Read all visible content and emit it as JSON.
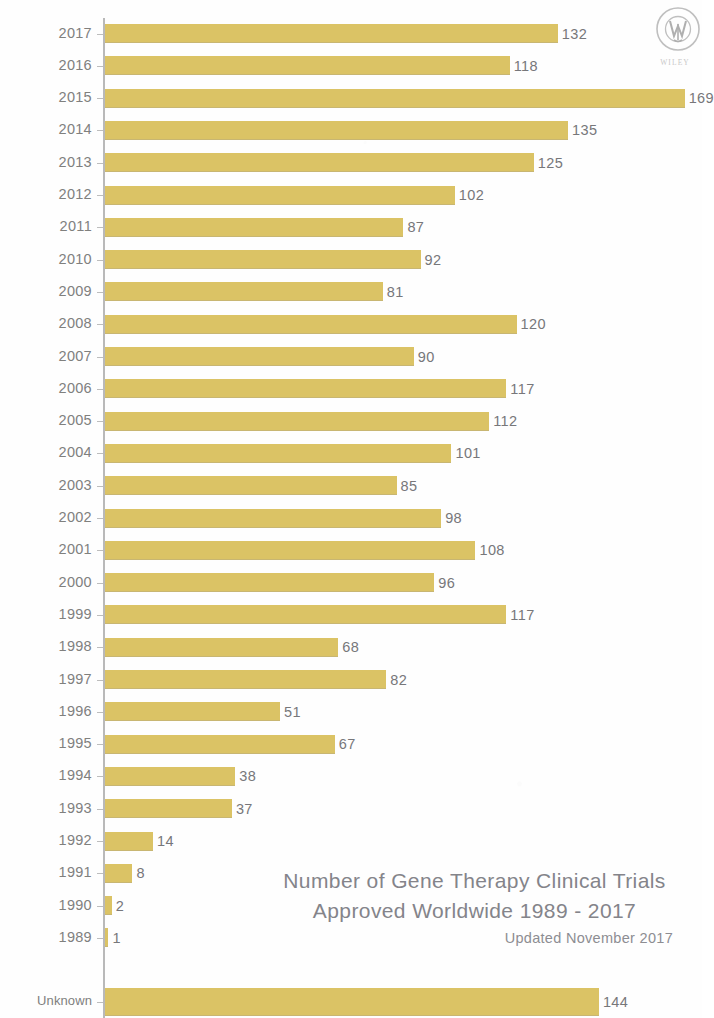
{
  "logo": {
    "name": "wiley-logo",
    "wordmark": "WILEY"
  },
  "chart_data": {
    "type": "bar",
    "orientation": "horizontal",
    "title": "Number of Gene Therapy Clinical Trials Approved Worldwide 1989 - 2017",
    "title_line_1": "Number of Gene Therapy Clinical Trials",
    "title_line_2": "Approved Worldwide 1989 - 2017",
    "subtitle": "Updated November 2017",
    "xlabel": "",
    "ylabel": "",
    "grid": false,
    "legend": false,
    "bar_color": "#dbc365",
    "label_color": "#7d7d80",
    "axis_color": "#b9b9b9",
    "xlim": [
      0,
      175
    ],
    "categories": [
      "2017",
      "2016",
      "2015",
      "2014",
      "2013",
      "2012",
      "2011",
      "2010",
      "2009",
      "2008",
      "2007",
      "2006",
      "2005",
      "2004",
      "2003",
      "2002",
      "2001",
      "2000",
      "1999",
      "1998",
      "1997",
      "1996",
      "1995",
      "1994",
      "1993",
      "1992",
      "1991",
      "1990",
      "1989",
      "Unknown"
    ],
    "values": [
      132,
      118,
      169,
      135,
      125,
      102,
      87,
      92,
      81,
      120,
      90,
      117,
      112,
      101,
      85,
      98,
      108,
      96,
      117,
      68,
      82,
      51,
      67,
      38,
      37,
      14,
      8,
      2,
      1,
      144
    ],
    "points": [
      {
        "category": "2017",
        "value": 132,
        "label": "132"
      },
      {
        "category": "2016",
        "value": 118,
        "label": "118"
      },
      {
        "category": "2015",
        "value": 169,
        "label": "169"
      },
      {
        "category": "2014",
        "value": 135,
        "label": "135"
      },
      {
        "category": "2013",
        "value": 125,
        "label": "125"
      },
      {
        "category": "2012",
        "value": 102,
        "label": "102"
      },
      {
        "category": "2011",
        "value": 87,
        "label": "87"
      },
      {
        "category": "2010",
        "value": 92,
        "label": "92"
      },
      {
        "category": "2009",
        "value": 81,
        "label": "81"
      },
      {
        "category": "2008",
        "value": 120,
        "label": "120"
      },
      {
        "category": "2007",
        "value": 90,
        "label": "90"
      },
      {
        "category": "2006",
        "value": 117,
        "label": "117"
      },
      {
        "category": "2005",
        "value": 112,
        "label": "112"
      },
      {
        "category": "2004",
        "value": 101,
        "label": "101"
      },
      {
        "category": "2003",
        "value": 85,
        "label": "85"
      },
      {
        "category": "2002",
        "value": 98,
        "label": "98"
      },
      {
        "category": "2001",
        "value": 108,
        "label": "108"
      },
      {
        "category": "2000",
        "value": 96,
        "label": "96"
      },
      {
        "category": "1999",
        "value": 117,
        "label": "117"
      },
      {
        "category": "1998",
        "value": 68,
        "label": "68"
      },
      {
        "category": "1997",
        "value": 82,
        "label": "82"
      },
      {
        "category": "1996",
        "value": 51,
        "label": "51"
      },
      {
        "category": "1995",
        "value": 67,
        "label": "67"
      },
      {
        "category": "1994",
        "value": 38,
        "label": "38"
      },
      {
        "category": "1993",
        "value": 37,
        "label": "37"
      },
      {
        "category": "1992",
        "value": 14,
        "label": "14"
      },
      {
        "category": "1991",
        "value": 8,
        "label": "8"
      },
      {
        "category": "1990",
        "value": 2,
        "label": "2"
      },
      {
        "category": "1989",
        "value": 1,
        "label": "1"
      },
      {
        "category": "Unknown",
        "value": 144,
        "label": "144"
      }
    ]
  }
}
